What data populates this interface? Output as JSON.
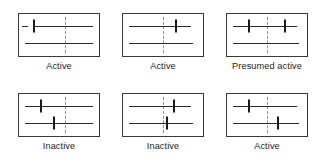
{
  "figure": {
    "type": "forest-plot-panel-grid",
    "width": 323,
    "height": 158,
    "background": "#ffffff",
    "line_color": "#2b2b2b",
    "box_color": "#3a3a3a",
    "reference_line_color": "#8d8d8d",
    "label_color": "#1b1b1b"
  },
  "panels": [
    {
      "id": "panel-1",
      "label": "Active",
      "x": 18,
      "y": 13,
      "w": 82,
      "reference_x_pct": 57,
      "rows": [
        {
          "y_pct": 28,
          "stub": {
            "start_pct": 4,
            "end_pct": 11
          },
          "line": {
            "start_pct": 19,
            "end_pct": 92
          },
          "tick_pct": 19
        },
        {
          "y_pct": 70,
          "line": {
            "start_pct": 7,
            "end_pct": 92
          },
          "tick_pct": null
        }
      ]
    },
    {
      "id": "panel-2",
      "label": "Active",
      "x": 122,
      "y": 13,
      "w": 82,
      "reference_x_pct": 50,
      "rows": [
        {
          "y_pct": 28,
          "line": {
            "start_pct": 7,
            "end_pct": 85
          },
          "tick_pct": 66
        },
        {
          "y_pct": 70,
          "line": {
            "start_pct": 7,
            "end_pct": 88
          },
          "tick_pct": null
        }
      ]
    },
    {
      "id": "panel-3",
      "label": "Presumed active",
      "x": 226,
      "y": 13,
      "w": 82,
      "reference_x_pct": 50,
      "rows": [
        {
          "y_pct": 28,
          "line": {
            "start_pct": 8,
            "end_pct": 88
          },
          "tick_pct": 27,
          "tick2_pct": 72
        },
        {
          "y_pct": 70,
          "line": {
            "start_pct": 8,
            "end_pct": 90
          },
          "tick_pct": null
        }
      ]
    },
    {
      "id": "panel-4",
      "label": "Inactive",
      "x": 18,
      "y": 93,
      "w": 82,
      "reference_x_pct": 57,
      "rows": [
        {
          "y_pct": 28,
          "line": {
            "start_pct": 7,
            "end_pct": 92
          },
          "tick_pct": 27
        },
        {
          "y_pct": 70,
          "line": {
            "start_pct": 7,
            "end_pct": 92
          },
          "tick_pct": 44
        }
      ]
    },
    {
      "id": "panel-5",
      "label": "Inactive",
      "x": 122,
      "y": 93,
      "w": 82,
      "reference_x_pct": 50,
      "rows": [
        {
          "y_pct": 28,
          "line": {
            "start_pct": 7,
            "end_pct": 85
          },
          "tick_pct": 64
        },
        {
          "y_pct": 70,
          "line": {
            "start_pct": 7,
            "end_pct": 88
          },
          "tick_pct": 55
        }
      ]
    },
    {
      "id": "panel-6",
      "label": "Active",
      "x": 226,
      "y": 93,
      "w": 82,
      "reference_x_pct": 50,
      "rows": [
        {
          "y_pct": 28,
          "line": {
            "start_pct": 7,
            "end_pct": 88
          },
          "tick_pct": 27
        },
        {
          "y_pct": 70,
          "line": {
            "start_pct": 7,
            "end_pct": 90
          },
          "tick_pct": 64
        }
      ]
    }
  ]
}
